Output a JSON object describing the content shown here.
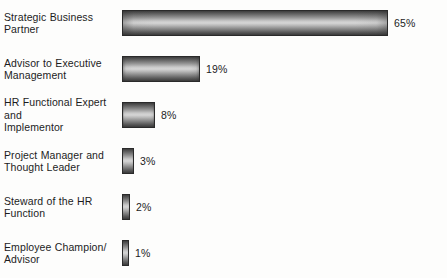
{
  "chart_data": {
    "type": "bar",
    "orientation": "horizontal",
    "title": "",
    "xlabel": "",
    "ylabel": "",
    "xlim": [
      0,
      65
    ],
    "grid": false,
    "legend": "none",
    "value_suffix": "%",
    "categories": [
      "Strategic Business Partner",
      "Advisor to Executive Management",
      "HR Functional Expert and Implementor",
      "Project Manager and Thought Leader",
      "Steward of the HR Function",
      "Employee Champion/ Advisor"
    ],
    "values": [
      65,
      19,
      8,
      3,
      2,
      1
    ],
    "value_labels": [
      "65%",
      "19%",
      "8%",
      "3%",
      "2%",
      "1%"
    ],
    "bars": [
      {
        "label_line1": "Strategic Business",
        "label_line2": "Partner",
        "value": 65,
        "value_label": "65%"
      },
      {
        "label_line1": "Advisor to Executive",
        "label_line2": "Management",
        "value": 19,
        "value_label": "19%"
      },
      {
        "label_line1": "HR Functional Expert and",
        "label_line2": "Implementor",
        "value": 8,
        "value_label": "8%"
      },
      {
        "label_line1": "Project Manager and",
        "label_line2": "Thought Leader",
        "value": 3,
        "value_label": "3%"
      },
      {
        "label_line1": "Steward of the HR",
        "label_line2": "Function",
        "value": 2,
        "value_label": "2%"
      },
      {
        "label_line1": "Employee Champion/",
        "label_line2": "Advisor",
        "value": 1,
        "value_label": "1%"
      }
    ]
  },
  "style": {
    "bar_dark": "#3a3a3a",
    "bar_light": "#d6d6d6",
    "bar_border": "#2a2a2a",
    "text_color": "#1c1c1c",
    "background": "#fdfdfc"
  }
}
